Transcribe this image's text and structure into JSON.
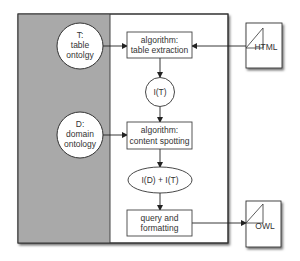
{
  "diagram": {
    "panels": {
      "gray_panel_color": "#a9a9a9",
      "white_panel_color": "#ffffff"
    },
    "nodes": {
      "table_ontology": {
        "lines": [
          "T:",
          "table",
          "ontolgy"
        ]
      },
      "domain_ontology": {
        "lines": [
          "D:",
          "domain",
          "ontology"
        ]
      },
      "table_extraction": {
        "lines": [
          "algorithm:",
          "table extraction"
        ]
      },
      "interp_t": {
        "label": "I(T)"
      },
      "content_spotting": {
        "lines": [
          "algorithm:",
          "content spotting"
        ]
      },
      "interp_dt": {
        "label": "I(D) + I(T)"
      },
      "query_formatting": {
        "lines": [
          "query and",
          "formatting"
        ]
      },
      "html_doc": {
        "label": "HTML"
      },
      "owl_doc": {
        "label": "OWL"
      }
    },
    "edges": [
      {
        "from": "table_ontology",
        "to": "table_extraction"
      },
      {
        "from": "html_doc",
        "to": "table_extraction"
      },
      {
        "from": "table_extraction",
        "to": "interp_t"
      },
      {
        "from": "interp_t",
        "to": "content_spotting"
      },
      {
        "from": "domain_ontology",
        "to": "content_spotting"
      },
      {
        "from": "content_spotting",
        "to": "interp_dt"
      },
      {
        "from": "interp_dt",
        "to": "query_formatting"
      },
      {
        "from": "query_formatting",
        "to": "owl_doc"
      }
    ]
  }
}
